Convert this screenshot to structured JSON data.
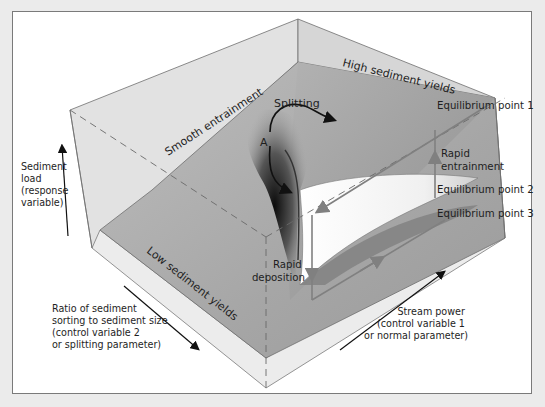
{
  "diagram": {
    "type": "cusp-catastrophe-surface",
    "axes": {
      "vertical": {
        "label_lines": [
          "Sediment",
          "load",
          "(response",
          "variable)"
        ]
      },
      "left_horizontal": {
        "label_lines": [
          "Ratio of sediment",
          "sorting to sediment size",
          "(control variable 2",
          "or splitting parameter)"
        ]
      },
      "right_horizontal": {
        "label_lines": [
          "Stream power",
          "(control variable 1",
          "or normal parameter)"
        ]
      }
    },
    "surface_labels": {
      "smooth": "Smooth entrainment",
      "high": "High sediment yields",
      "low": "Low sediment yields",
      "splitting": "Splitting",
      "point_a": "A"
    },
    "equilibrium_points": [
      {
        "label": "Equilibrium point 1"
      },
      {
        "label": "Equilibrium point 2"
      },
      {
        "label": "Equilibrium point 3"
      }
    ],
    "transitions": {
      "entrainment_lines": [
        "Rapid",
        "entrainment"
      ],
      "deposition_lines": [
        "Rapid",
        "deposition"
      ]
    },
    "colors": {
      "background": "#ebebeb",
      "panel": "#ffffff",
      "box_face_light": "#e4e4e4",
      "box_face_mid": "#d2d2d2",
      "surface_upper": "#a9a9a9",
      "surface_lower": "#b8b8b8",
      "fold_white": "#f6f6f6",
      "path_line": "#7d7d7d",
      "arrow": "#111111"
    }
  }
}
